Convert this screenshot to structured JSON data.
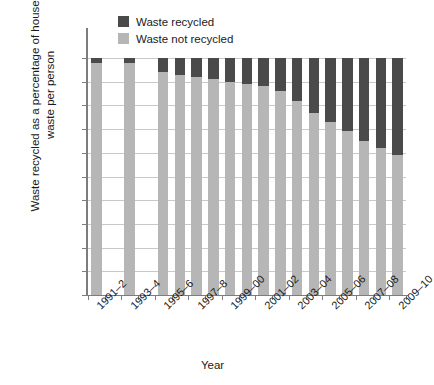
{
  "chart_data": {
    "type": "bar",
    "subtype": "stacked-bar-100-percent",
    "title": "",
    "xlabel": "Year",
    "ylabel": "Waste recycled as a percentage of household waste per person",
    "ylim": [
      0,
      100
    ],
    "ytick_labels": [
      "0%",
      "10%",
      "20%",
      "30%",
      "40%",
      "50%",
      "60%",
      "70%",
      "80%",
      "90%",
      "100%"
    ],
    "ytick_values": [
      0,
      10,
      20,
      30,
      40,
      50,
      60,
      70,
      80,
      90,
      100
    ],
    "grid": true,
    "legend_position": "top-center",
    "categories": [
      "1991–2",
      "1992–3",
      "1993–4",
      "1994–5",
      "1995–6",
      "1996–7",
      "1997–8",
      "1998–9",
      "1999–00",
      "2000–01",
      "2001–02",
      "2002–03",
      "2003–04",
      "2004–05",
      "2005–06",
      "2006–07",
      "2007–08",
      "2008–09",
      "2009–10"
    ],
    "xtick_labels": [
      "1991–2",
      "1993–4",
      "1995–6",
      "1997–8",
      "1999–00",
      "2001–02",
      "2003–04",
      "2005–06",
      "2007–08",
      "2009–10"
    ],
    "xtick_label_indices": [
      0,
      2,
      4,
      6,
      8,
      10,
      12,
      14,
      16,
      18
    ],
    "series": [
      {
        "name": "Waste not recycled",
        "color": "#b6b6b6",
        "values": [
          98,
          null,
          98,
          null,
          94,
          93,
          92,
          91,
          90,
          89,
          88,
          86,
          82,
          77,
          73,
          69,
          65,
          62,
          59
        ]
      },
      {
        "name": "Waste recycled",
        "color": "#4a4a4a",
        "values": [
          2,
          null,
          2,
          null,
          6,
          7,
          8,
          9,
          10,
          11,
          12,
          14,
          18,
          23,
          27,
          31,
          35,
          38,
          41
        ]
      }
    ],
    "missing_categories": [
      "1992–3",
      "1994–5"
    ]
  },
  "legend": {
    "items": [
      {
        "label": "Waste recycled",
        "color": "#4a4a4a"
      },
      {
        "label": "Waste not recycled",
        "color": "#b6b6b6"
      }
    ]
  },
  "axis_colors": {
    "axis_line": "#7d7d7d",
    "gridline": "#c9c9c9",
    "text": "#1a1a1a",
    "background": "#ffffff"
  }
}
